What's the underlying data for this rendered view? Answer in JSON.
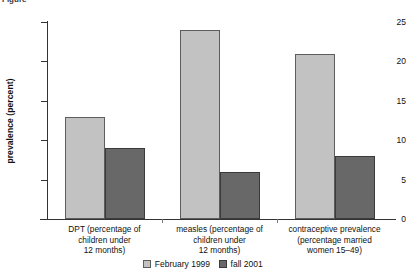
{
  "caption_remnant": "Figure",
  "chart_data": {
    "type": "bar",
    "title": "",
    "xlabel": "",
    "ylabel": "prevalence (percent)",
    "ylim": [
      0,
      25
    ],
    "yticks": [
      0,
      5,
      10,
      15,
      20,
      25
    ],
    "ytick_labels": [
      "0",
      "5",
      "10",
      "15",
      "20",
      "25"
    ],
    "grid": false,
    "legend_position": "bottom-center",
    "categories": [
      "DPT (percentage of\nchildren under\n12 months)",
      "measles (percentage of\nchildren under\n12 months)",
      "contraceptive prevalence\n(percentage married\nwomen 15–49)"
    ],
    "category_lines": [
      [
        "DPT (percentage of",
        "children under",
        "12 months)"
      ],
      [
        "measles (percentage of",
        "children under",
        "12 months)"
      ],
      [
        "contraceptive prevalence",
        "(percentage married",
        "women 15–49)"
      ]
    ],
    "series": [
      {
        "name": "February 1999",
        "color": "#c2c2c2",
        "values": [
          13,
          24,
          21
        ]
      },
      {
        "name": "fall 2001",
        "color": "#686868",
        "values": [
          9,
          6,
          8
        ]
      }
    ]
  }
}
